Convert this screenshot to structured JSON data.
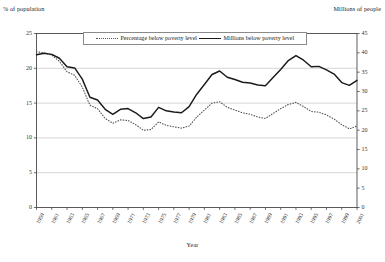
{
  "chart_data": {
    "type": "line",
    "title": "",
    "xlabel": "Year",
    "ylabel_left": "% of population",
    "ylabel_right": "Millions of people",
    "grid": true,
    "legend_position": "top-center",
    "ylim_left": [
      0,
      25
    ],
    "ylim_right": [
      0,
      45
    ],
    "yticks_left": [
      0,
      5,
      10,
      15,
      20,
      25
    ],
    "yticks_right": [
      0,
      5,
      10,
      15,
      20,
      25,
      30,
      35,
      40,
      45
    ],
    "xticks": [
      "1959",
      "1961",
      "1963",
      "1965",
      "1967",
      "1969",
      "1971",
      "1973",
      "1975",
      "1977",
      "1979",
      "1981",
      "1983",
      "1985",
      "1987",
      "1989",
      "1991",
      "1993",
      "1995",
      "1997",
      "1999",
      "2001"
    ],
    "x": [
      1959,
      1960,
      1961,
      1962,
      1963,
      1964,
      1965,
      1966,
      1967,
      1968,
      1969,
      1970,
      1971,
      1972,
      1973,
      1974,
      1975,
      1976,
      1977,
      1978,
      1979,
      1980,
      1981,
      1982,
      1983,
      1984,
      1985,
      1986,
      1987,
      1988,
      1989,
      1990,
      1991,
      1992,
      1993,
      1994,
      1995,
      1996,
      1997,
      1998,
      1999,
      2000,
      2001
    ],
    "series": [
      {
        "name": "Percentage below poverty level",
        "axis": "left",
        "style": "dotted",
        "color": "#555555",
        "unit": "%",
        "values": [
          22.4,
          22.2,
          21.9,
          21.0,
          19.5,
          19.0,
          17.3,
          14.7,
          14.2,
          12.8,
          12.1,
          12.6,
          12.5,
          11.9,
          11.1,
          11.2,
          12.3,
          11.8,
          11.6,
          11.4,
          11.7,
          13.0,
          14.0,
          15.0,
          15.2,
          14.4,
          14.0,
          13.6,
          13.4,
          13.0,
          12.8,
          13.5,
          14.2,
          14.8,
          15.1,
          14.5,
          13.8,
          13.7,
          13.3,
          12.7,
          11.9,
          11.3,
          11.7
        ]
      },
      {
        "name": "Millions below poverty level",
        "axis": "right",
        "style": "solid",
        "color": "#1a1a1a",
        "unit": "millions",
        "values": [
          39.5,
          39.9,
          39.6,
          38.6,
          36.4,
          36.1,
          33.2,
          28.5,
          27.8,
          25.4,
          24.1,
          25.4,
          25.6,
          24.5,
          23.0,
          23.4,
          25.9,
          25.0,
          24.7,
          24.5,
          26.1,
          29.3,
          31.8,
          34.4,
          35.3,
          33.7,
          33.1,
          32.4,
          32.2,
          31.7,
          31.5,
          33.6,
          35.7,
          38.0,
          39.3,
          38.1,
          36.4,
          36.5,
          35.6,
          34.5,
          32.3,
          31.6,
          32.9
        ]
      }
    ]
  },
  "legend": {
    "items": [
      {
        "label": "Percentage below poverty level",
        "marker": "dotted-line"
      },
      {
        "label": "Millions below poverty level",
        "marker": "solid-line"
      }
    ]
  }
}
